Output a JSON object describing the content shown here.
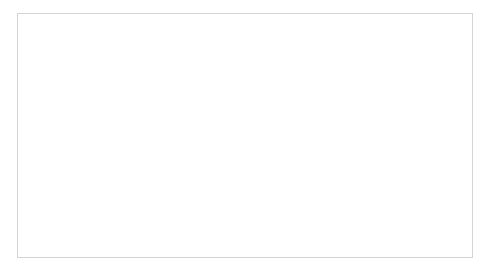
{
  "chart_data": {
    "type": "line",
    "title": "Communication Bandwidth -- Alltoall, 8 bytes",
    "xlabel": "Number of Messages",
    "ylabel": "Communication Bandwidth (bytes/second)",
    "ylabel_line1": "Communication Bandwidth",
    "ylabel_line2": "(bytes/second)",
    "xscale": "log",
    "yscale": "log",
    "xlim": [
      1,
      1000000
    ],
    "ylim": [
      1000000,
      100000000000
    ],
    "grid": true,
    "legend_position": "right",
    "x_tick_labels": [
      "1.E+00",
      "1.E+02",
      "1.E+04",
      "1.E+06"
    ],
    "x_tick_values": [
      1,
      100,
      10000,
      1000000
    ],
    "y_tick_labels": [
      "1.E+06",
      "1.E+07",
      "1.E+08",
      "1.E+09",
      "1.E+10",
      "1.E+11"
    ],
    "y_tick_values": [
      1000000,
      10000000,
      100000000,
      1000000000,
      10000000000,
      100000000000
    ],
    "series": [
      {
        "name": "MPI-IB",
        "color": "#6b6b6b",
        "marker": "diamond",
        "x": [
          2,
          4,
          8,
          16,
          32,
          64,
          128,
          256,
          512,
          1024,
          2048,
          4096,
          8192,
          16384,
          32768,
          65536,
          131072,
          262144,
          524288,
          1048576,
          2097152
        ],
        "y": [
          4200000,
          8300000,
          16500000,
          32500000,
          64000000,
          126000000,
          246000000,
          480000000,
          930000000,
          1780000000,
          3200000000,
          5200000000,
          7400000000,
          9200000000,
          10400000000,
          11200000000,
          11700000000,
          12000000000,
          12200000000,
          12350000000,
          12450000000
        ]
      },
      {
        "name": "Programmable Logic Network",
        "color": "#8a8a8a",
        "marker": "square",
        "x": [
          2,
          8,
          32,
          128,
          512,
          2048,
          8192,
          32768,
          131072,
          524288,
          2097152,
          8388608,
          33554432,
          134217728,
          536870912
        ],
        "y": [
          29000000,
          72000000,
          130000000,
          166000000,
          180000000,
          186000000,
          189000000,
          190000000,
          191000000,
          191500000,
          192000000,
          192000000,
          192000000,
          192000000,
          192000000
        ]
      }
    ],
    "legend_entries": [
      {
        "label": "MPI-IB",
        "color": "#6b6b6b",
        "marker": "diamond"
      },
      {
        "label": "Programmable Logic Network",
        "color": "#8a8a8a",
        "marker": "line"
      }
    ]
  },
  "legend": {
    "entry_0_label": "MPI-IB",
    "entry_1_label_line1": "Programmable Logic",
    "entry_1_label_line2": "Network"
  }
}
